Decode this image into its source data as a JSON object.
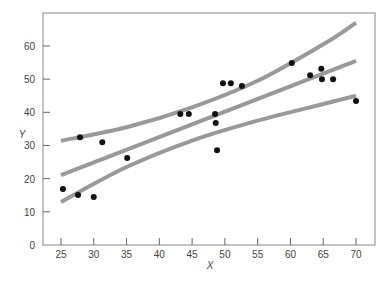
{
  "chart_data": {
    "type": "scatter",
    "title": "",
    "xlabel": "X",
    "ylabel": "Y",
    "xlim": [
      22.3,
      73
    ],
    "ylim": [
      0,
      70
    ],
    "x_ticks": [
      25,
      30,
      35,
      40,
      45,
      50,
      55,
      60,
      65,
      70
    ],
    "y_ticks": [
      0,
      10,
      20,
      30,
      40,
      50,
      60
    ],
    "grid": false,
    "legend": null,
    "points": [
      {
        "x": 25.3,
        "y": 16.9
      },
      {
        "x": 27.6,
        "y": 15.1
      },
      {
        "x": 27.9,
        "y": 32.5
      },
      {
        "x": 30.0,
        "y": 14.5
      },
      {
        "x": 31.3,
        "y": 31.0
      },
      {
        "x": 35.1,
        "y": 26.2
      },
      {
        "x": 43.2,
        "y": 39.5
      },
      {
        "x": 44.5,
        "y": 39.5
      },
      {
        "x": 48.5,
        "y": 39.5
      },
      {
        "x": 48.6,
        "y": 36.8
      },
      {
        "x": 48.8,
        "y": 28.6
      },
      {
        "x": 49.7,
        "y": 48.8
      },
      {
        "x": 50.9,
        "y": 48.8
      },
      {
        "x": 52.6,
        "y": 47.9
      },
      {
        "x": 60.2,
        "y": 54.9
      },
      {
        "x": 63.0,
        "y": 51.2
      },
      {
        "x": 64.7,
        "y": 53.1
      },
      {
        "x": 64.8,
        "y": 50.0
      },
      {
        "x": 66.5,
        "y": 50.0
      },
      {
        "x": 70.0,
        "y": 43.4
      }
    ],
    "series": [
      {
        "name": "upper band",
        "x": [
          25,
          35,
          45,
          55,
          65,
          70
        ],
        "y": [
          31.4,
          35.5,
          41.5,
          49.5,
          60.5,
          67
        ]
      },
      {
        "name": "regression line",
        "x": [
          25,
          70
        ],
        "y": [
          21.1,
          55.5
        ]
      },
      {
        "name": "lower band",
        "x": [
          25,
          35,
          45,
          55,
          65,
          70
        ],
        "y": [
          13,
          23.5,
          31.5,
          37.5,
          42.5,
          45
        ]
      }
    ],
    "colors": {
      "points": "#111111",
      "lines": "#999999",
      "axis": "#888888"
    }
  }
}
